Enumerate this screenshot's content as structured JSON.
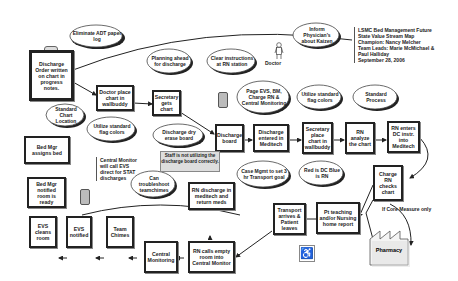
{
  "header": {
    "lines": [
      "LSMC Bed Management Future",
      "State Value Stream Map",
      "Champion:  Nancy Melcher",
      "Team Leads:  Marie McMichael &",
      "Paul Halliday",
      "September 28, 2006"
    ]
  },
  "process_boxes": {
    "discharge_order": "Discharge Order written on chart in progress notes.",
    "doctor_place_chart": "Doctor place chart in wallbuddy",
    "secretary_gets_chart": "Secretary gets chart",
    "discharge_board": "Discharge board",
    "discharge_entered": "Discharge entered in Meditech",
    "secretary_place_chart": "Secretary place chart in wallbuddy",
    "rn_analyze": "RN analyze the chart",
    "rn_enters_dc": "RN enters DC instr. into Meditech",
    "charge_rn_checks": "Charge RN checks chart",
    "pt_teaching": "Pt teaching and/or Nursing home report",
    "transport_arrives": "Transport arrives & Patient leaves",
    "rn_calls_empty": "RN calls empty room into Central Monitor",
    "rn_discharge_meditech": "RN discharge in meditech and return meds",
    "central_monitoring": "Central Monitoring",
    "team_chimes": "Team Chimes",
    "evs_notified": "EVS notified",
    "evs_cleans": "EVS cleans room",
    "bed_mgr_notified": "Bed Mgr notified room is ready",
    "bed_mgr_assigns": "Bed Mgr assigns bed",
    "pharmacy": "Pharmacy"
  },
  "kaizen_clouds": {
    "eliminate_adt": "Eliminate ADT paper log",
    "planning_ahead": "Planning ahead for discharge",
    "clear_instructions": "Clear instructions at RN station",
    "inform_physicians": "Inform Physician's about Kaizen",
    "page_evs": "Page EVS, BM, Charge RN & Central Monitoring",
    "utilize_flag_1": "Utilize standard flag colors",
    "standard_process": "Standard Process",
    "standard_chart": "Standard Chart Location",
    "utilize_flag_2": "Utilize standard flag colors",
    "dry_erase": "Discharge dry erase board",
    "case_mgmt": "Case Mgmt to set 3 hr Transport goal",
    "red_blue": "Red is DC Blue is RN",
    "troubleshoot": "Can troubleshoot teamchimes"
  },
  "notes": {
    "staff_not_utilizing": "Staff is not utilizing the discharge board correctly.",
    "central_monitor_evs": "Central Monitor will call EVS direct for STAT discharges",
    "core_measure": "If Core Measure only",
    "doctor_label": "Doctor"
  },
  "icons": {
    "doctor": "person-icon",
    "phone": "cell-phone-icon",
    "wheelchair": "wheelchair-icon",
    "factory": "factory-icon",
    "clipboard": "clipboard-icon"
  }
}
